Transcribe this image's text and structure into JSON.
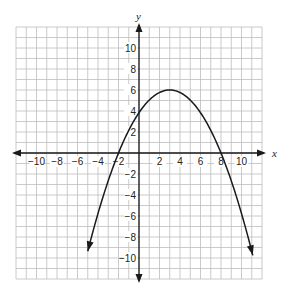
{
  "chart_data": {
    "type": "line",
    "title": "",
    "xlabel": "x",
    "ylabel": "y",
    "xlim": [
      -12,
      12
    ],
    "ylim": [
      -12,
      12
    ],
    "grid": true,
    "x_ticks": [
      -10,
      -8,
      -6,
      -4,
      -2,
      2,
      4,
      6,
      8,
      10
    ],
    "y_ticks": [
      10,
      8,
      6,
      4,
      2,
      -2,
      -4,
      -6,
      -8,
      -10
    ],
    "series": [
      {
        "name": "parabola",
        "equation": "y = -0.24(x + 2)(x - 8)",
        "vertex": [
          3,
          6
        ],
        "x_intercepts": [
          -2,
          8
        ],
        "y_intercept": 3.84,
        "x_range": [
          -5,
          11.1
        ],
        "arrows_on_ends": true,
        "points": [
          [
            -5,
            -9.36
          ],
          [
            -4,
            -7.2
          ],
          [
            -2,
            0
          ],
          [
            0,
            3.84
          ],
          [
            2,
            5.76
          ],
          [
            3,
            6
          ],
          [
            4,
            5.76
          ],
          [
            6,
            3.84
          ],
          [
            8,
            0
          ],
          [
            10,
            -5.76
          ],
          [
            11,
            -9.36
          ]
        ]
      }
    ]
  },
  "colors": {
    "grid": "#bdbdbd",
    "axes": "#1a1a1a",
    "curve": "#1a1a1a",
    "background": "#ffffff"
  }
}
